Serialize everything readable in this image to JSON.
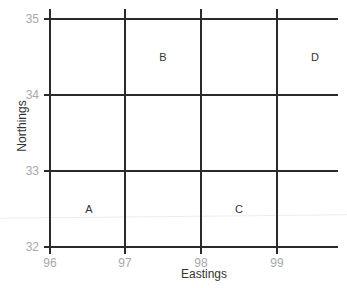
{
  "diagram": {
    "type": "grid-reference-map",
    "x_axis": {
      "title": "Eastings",
      "ticks": [
        "96",
        "97",
        "98",
        "99"
      ]
    },
    "y_axis": {
      "title": "Northings",
      "ticks": [
        "35",
        "34",
        "33",
        "32"
      ]
    },
    "cells": [
      {
        "label": "A",
        "easting": "96",
        "northing": "32"
      },
      {
        "label": "B",
        "easting": "97",
        "northing": "34"
      },
      {
        "label": "C",
        "easting": "98",
        "northing": "32"
      },
      {
        "label": "D",
        "easting": "99",
        "northing": "34"
      }
    ],
    "colors": {
      "grid_line": "#2a2a2a",
      "tick_label": "#a8a8a8",
      "text": "#333333"
    }
  }
}
